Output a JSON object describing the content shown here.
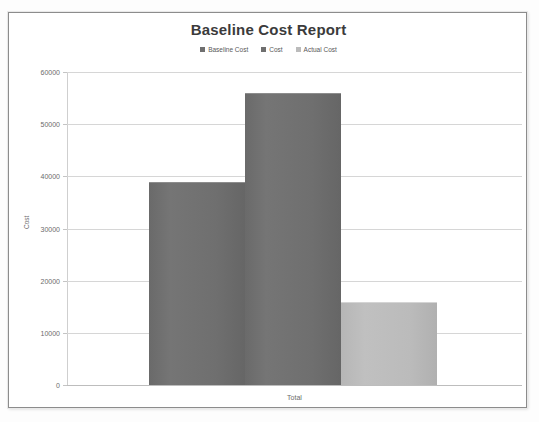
{
  "chart_data": {
    "type": "bar",
    "title": "Baseline Cost Report",
    "xlabel": "",
    "ylabel": "Cost",
    "categories": [
      "Total"
    ],
    "series": [
      {
        "name": "Baseline Cost",
        "values": [
          39000
        ],
        "color": "#6f6f6f"
      },
      {
        "name": "Cost",
        "values": [
          56000
        ],
        "color": "#6f6f6f"
      },
      {
        "name": "Actual Cost",
        "values": [
          16000
        ],
        "color": "#bbbbbb"
      }
    ],
    "ylim": [
      0,
      60000
    ],
    "ytick_labels": [
      "0",
      "10000",
      "20000",
      "30000",
      "40000",
      "50000",
      "60000"
    ],
    "ytick_values": [
      0,
      10000,
      20000,
      30000,
      40000,
      50000,
      60000
    ],
    "grid": true,
    "legend_position": "top"
  },
  "chart": {
    "title": "Baseline Cost Report",
    "y_axis_title": "Cost",
    "x_axis_label": "Total"
  },
  "legend": {
    "items": [
      {
        "label": "Baseline Cost",
        "color": "#6f6f6f"
      },
      {
        "label": "Cost",
        "color": "#6f6f6f"
      },
      {
        "label": "Actual Cost",
        "color": "#bbbbbb"
      }
    ]
  },
  "y_ticks": [
    {
      "label": "60000",
      "value": 60000
    },
    {
      "label": "50000",
      "value": 50000
    },
    {
      "label": "40000",
      "value": 40000
    },
    {
      "label": "30000",
      "value": 30000
    },
    {
      "label": "20000",
      "value": 20000
    },
    {
      "label": "10000",
      "value": 10000
    },
    {
      "label": "0",
      "value": 0
    }
  ],
  "bars": [
    {
      "name": "Baseline Cost",
      "value": 39000
    },
    {
      "name": "Cost",
      "value": 56000
    },
    {
      "name": "Actual Cost",
      "value": 16000
    }
  ]
}
